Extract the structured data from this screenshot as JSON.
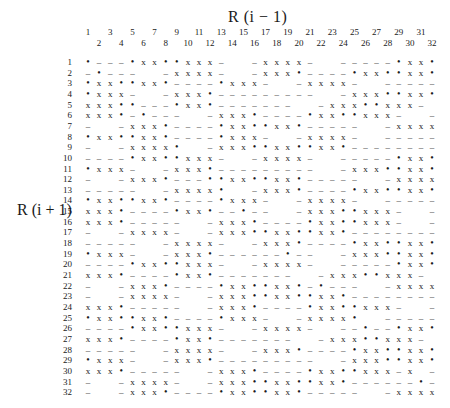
{
  "column_axis_label": "R (i − 1)",
  "row_axis_label": "R (i + 1)",
  "columns": [
    "1",
    "2",
    "3",
    "4",
    "5",
    "6",
    "7",
    "8",
    "9",
    "10",
    "11",
    "12",
    "13",
    "14",
    "15",
    "16",
    "17",
    "18",
    "19",
    "20",
    "21",
    "22",
    "23",
    "24",
    "25",
    "26",
    "27",
    "28",
    "29",
    "30",
    "31",
    "32"
  ],
  "rows": [
    "1",
    "2",
    "3",
    "4",
    "5",
    "6",
    "7",
    "8",
    "9",
    "10",
    "11",
    "12",
    "13",
    "14",
    "15",
    "16",
    "17",
    "18",
    "19",
    "20",
    "21",
    "22",
    "23",
    "24",
    "25",
    "26",
    "27",
    "28",
    "29",
    "30",
    "31",
    "32"
  ],
  "legend": {
    "x": "x",
    "star": "•",
    "dash": "–",
    "blank": "."
  },
  "grid": [
    "*---*xx**xxx-..-xxxx-..-----*xx*",
    "-*---..-xxxx-..-xxx*----*xx**xx*",
    "*xx**xx*----*xxx-..-xxxx-..-----",
    "*xxx-..-xxx*---------..-xxx**xx*",
    "xxx**---*xx*-------..-xxx**xxx-..-",
    "xxx*-*---..-xxx*----*xx**xxx-..-",
    "-..-xxx*----*xx**xx*-----..-xxxx",
    "*xx**xx*----*xxx-..-xxxx-..-----",
    "-..-xxxx*..-xxx**xx**xx*--------",
    "----*xx**xxx-..-xxxx-..-----*xx*",
    "*xxx-..-xxx*---------..-xxx**xx*",
    "-..-xxx*---**xx**xx*-----..-xxxx",
    "-----..-xxxx*..-xxx*----*xx**xx*",
    "*xx**xx*----*xxx-..-xxxx-..-----",
    "xxx*----*xx*--*--..-xxx**xxx-..-",
    "xxx*-----..-xxx*----*xx**xxx-..-",
    "-..-xxxx-..-xxx**xx**xx*--------",
    "-----..-xxxx-..-xxx*----*xx**xx*",
    "*xxx-..-xxx*------*--..-xxx**xx*",
    "----*xx**xxx-..-xxxx-..-----*xx*",
    "xxx*----*xx*-------..-xxx**xxx-..-",
    "-..-xxx*----*xx**xx*-*---..-xxxx",
    "-..-xxxx-..-xxx**xx**xx*--------",
    "xxx*-----..-xxx*----*xx**xxx-..-",
    "*xx**xx*----*xxx-..-xxxx*..-----",
    "----*xx**xxx-..-xxxx-..--*--*xx*",
    "xxx*----*xx*-------..-xxx**xxx-..-",
    "-----..-xxxx-..-xxx*----*xx**xx*",
    "*xxx-..-xxx*---------..-xxx**xx*",
    "xxx*-----..-xxx*----*xx**xxx-x.-",
    "-..-xxxx-..-xxx**xx**xx*------*-",
    "-..-xxx*----*xx**xx*-----..-xxxx"
  ]
}
